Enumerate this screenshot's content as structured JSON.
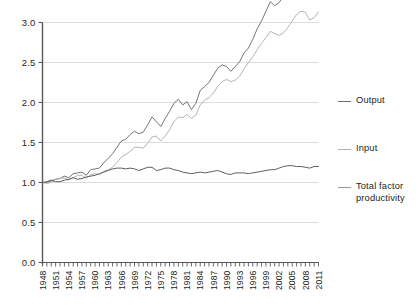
{
  "chart_data": {
    "type": "line",
    "title": "",
    "subtitle": "",
    "xlabel": "",
    "ylabel": "",
    "xlim": [
      1948,
      2011
    ],
    "ylim": [
      0.0,
      3.0
    ],
    "yticks": [
      "0.0",
      "0.5",
      "1.0",
      "1.5",
      "2.0",
      "2.5",
      "3.0"
    ],
    "ytick_values": [
      0.0,
      0.5,
      1.0,
      1.5,
      2.0,
      2.5,
      3.0
    ],
    "xticks": [
      "1948",
      "1951",
      "1954",
      "1957",
      "1960",
      "1963",
      "1966",
      "1969",
      "1972",
      "1975",
      "1978",
      "1981",
      "1984",
      "1987",
      "1990",
      "1993",
      "1996",
      "1999",
      "2002",
      "2005",
      "2008",
      "2011"
    ],
    "xtick_values": [
      1948,
      1951,
      1954,
      1957,
      1960,
      1963,
      1966,
      1969,
      1972,
      1975,
      1978,
      1981,
      1984,
      1987,
      1990,
      1993,
      1996,
      1999,
      2002,
      2005,
      2008,
      2011
    ],
    "x": [
      1948,
      1949,
      1950,
      1951,
      1952,
      1953,
      1954,
      1955,
      1956,
      1957,
      1958,
      1959,
      1960,
      1961,
      1962,
      1963,
      1964,
      1965,
      1966,
      1967,
      1968,
      1969,
      1970,
      1971,
      1972,
      1973,
      1974,
      1975,
      1976,
      1977,
      1978,
      1979,
      1980,
      1981,
      1982,
      1983,
      1984,
      1985,
      1986,
      1987,
      1988,
      1989,
      1990,
      1991,
      1992,
      1993,
      1994,
      1995,
      1996,
      1997,
      1998,
      1999,
      2000,
      2001,
      2002,
      2003,
      2004,
      2005,
      2006,
      2007,
      2008,
      2009,
      2010,
      2011
    ],
    "grid": true,
    "grid_axis": "y",
    "legend_position": "right",
    "series": [
      {
        "name": "Output",
        "color": "#6e6e6e",
        "values": [
          1.0,
          1.0,
          1.03,
          1.05,
          1.06,
          1.09,
          1.08,
          1.13,
          1.14,
          1.15,
          1.12,
          1.19,
          1.21,
          1.22,
          1.29,
          1.34,
          1.4,
          1.48,
          1.56,
          1.58,
          1.64,
          1.68,
          1.66,
          1.68,
          1.77,
          1.87,
          1.82,
          1.76,
          1.86,
          1.95,
          2.05,
          2.1,
          2.04,
          2.08,
          1.99,
          2.07,
          2.23,
          2.28,
          2.33,
          2.42,
          2.51,
          2.55,
          2.54,
          2.49,
          2.55,
          2.61,
          2.72,
          2.78,
          2.89,
          3.02,
          3.12,
          3.24,
          3.36,
          3.32,
          3.36,
          3.44,
          3.56,
          3.66,
          3.74,
          3.78,
          3.72,
          3.56,
          3.68,
          3.75
        ],
        "display_values": [
          1.0,
          1.0,
          1.02,
          1.04,
          1.05,
          1.08,
          1.06,
          1.11,
          1.12,
          1.13,
          1.09,
          1.16,
          1.17,
          1.18,
          1.25,
          1.3,
          1.36,
          1.44,
          1.52,
          1.54,
          1.6,
          1.64,
          1.61,
          1.63,
          1.72,
          1.82,
          1.76,
          1.7,
          1.8,
          1.89,
          1.99,
          2.04,
          1.97,
          2.01,
          1.91,
          1.99,
          2.15,
          2.2,
          2.25,
          2.34,
          2.43,
          2.47,
          2.45,
          2.39,
          2.45,
          2.51,
          2.62,
          2.68,
          2.79,
          2.92,
          3.02,
          3.14,
          3.26,
          3.21,
          3.25,
          3.33,
          3.45,
          3.55,
          3.63,
          3.67,
          3.6,
          3.44,
          3.56,
          3.63
        ]
      },
      {
        "name": "Input",
        "color": "#b0b0b0",
        "values": [
          1.0,
          0.99,
          1.0,
          1.04,
          1.05,
          1.06,
          1.03,
          1.06,
          1.09,
          1.09,
          1.05,
          1.1,
          1.11,
          1.1,
          1.14,
          1.16,
          1.19,
          1.25,
          1.32,
          1.35,
          1.39,
          1.44,
          1.44,
          1.43,
          1.49,
          1.57,
          1.58,
          1.52,
          1.58,
          1.66,
          1.76,
          1.82,
          1.81,
          1.85,
          1.8,
          1.84,
          1.97,
          2.03,
          2.06,
          2.12,
          2.2,
          2.26,
          2.29,
          2.26,
          2.28,
          2.33,
          2.42,
          2.5,
          2.57,
          2.66,
          2.74,
          2.81,
          2.89,
          2.86,
          2.84,
          2.87,
          2.94,
          3.02,
          3.1,
          3.14,
          3.13,
          3.03,
          3.06,
          3.13
        ]
      },
      {
        "name": "Total factor productivity",
        "color": "#555555",
        "values": [
          1.0,
          1.01,
          1.03,
          1.01,
          1.01,
          1.03,
          1.04,
          1.06,
          1.04,
          1.05,
          1.07,
          1.08,
          1.09,
          1.11,
          1.13,
          1.15,
          1.17,
          1.18,
          1.18,
          1.17,
          1.18,
          1.17,
          1.15,
          1.17,
          1.19,
          1.19,
          1.15,
          1.16,
          1.18,
          1.18,
          1.16,
          1.15,
          1.13,
          1.12,
          1.11,
          1.12,
          1.13,
          1.12,
          1.13,
          1.14,
          1.15,
          1.13,
          1.11,
          1.1,
          1.12,
          1.12,
          1.12,
          1.11,
          1.12,
          1.13,
          1.14,
          1.15,
          1.16,
          1.16,
          1.18,
          1.2,
          1.21,
          1.21,
          1.2,
          1.2,
          1.19,
          1.18,
          1.2,
          1.2
        ]
      }
    ]
  },
  "legend": {
    "entries": [
      {
        "label": "Output",
        "color": "#6e6e6e"
      },
      {
        "label": "Input",
        "color": "#b0b0b0"
      },
      {
        "label": "Total factor\nproductivity",
        "color": "#9a9a9a"
      }
    ]
  },
  "axes": {
    "y_tick_labels": [
      "3.0",
      "2.5",
      "2.0",
      "1.5",
      "1.0",
      "0.5",
      "0.0"
    ],
    "x_tick_labels": [
      "1948",
      "1951",
      "1954",
      "1957",
      "1960",
      "1963",
      "1966",
      "1969",
      "1972",
      "1975",
      "1978",
      "1981",
      "1984",
      "1987",
      "1990",
      "1993",
      "1996",
      "1999",
      "2002",
      "2005",
      "2008",
      "2011"
    ]
  },
  "colors": {
    "gridline": "#d9d9d9",
    "axis": "#58585a",
    "text": "#231f20",
    "background": "#ffffff"
  }
}
